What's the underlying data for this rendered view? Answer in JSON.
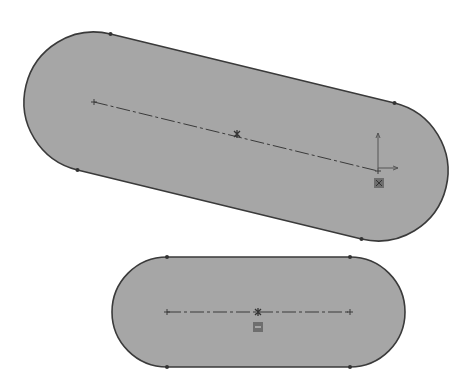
{
  "canvas": {
    "width": 474,
    "height": 387,
    "background": "#ffffff"
  },
  "colors": {
    "fill": "#a6a6a6",
    "outline": "#3a3a3a",
    "centerline": "#3a3a3a",
    "vertex": "#333333",
    "relation_badge": "#6e6e6e"
  },
  "slots": [
    {
      "name": "inclined-slot",
      "center_a": [
        94,
        102
      ],
      "center_b": [
        378,
        171
      ],
      "radius": 70,
      "tangent_points": [
        [
          112,
          33
        ],
        [
          398,
          99
        ],
        [
          365,
          240
        ],
        [
          80,
          171
        ]
      ],
      "midpoint": [
        237,
        134
      ],
      "origin_axes": {
        "at": [
          378,
          168
        ],
        "y_tip": [
          378,
          133
        ],
        "x_tip": [
          398,
          168
        ]
      },
      "relation_badge": {
        "at": [
          379,
          183
        ],
        "glyph": "coincident"
      }
    },
    {
      "name": "horizontal-slot",
      "center_a": [
        167,
        312
      ],
      "center_b": [
        350,
        312
      ],
      "radius": 55,
      "tangent_points": [
        [
          167,
          257
        ],
        [
          350,
          257
        ],
        [
          350,
          367
        ],
        [
          167,
          367
        ]
      ],
      "midpoint": [
        258,
        312
      ],
      "relation_badge": {
        "at": [
          258,
          327
        ],
        "glyph": "horizontal"
      }
    }
  ]
}
